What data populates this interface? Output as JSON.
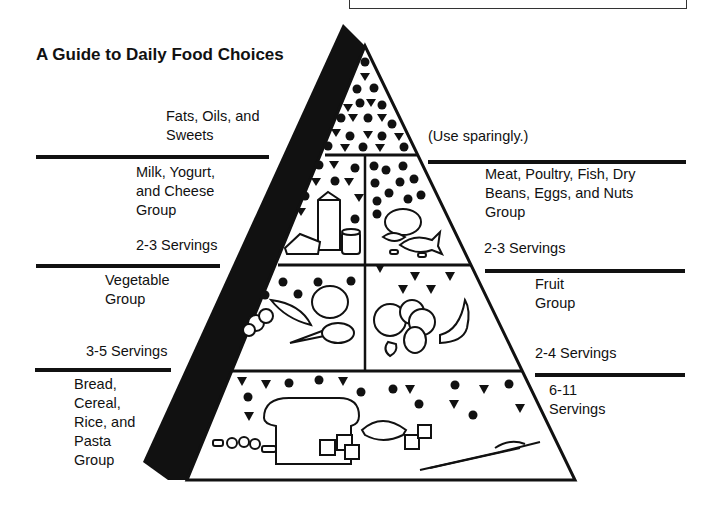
{
  "title": "A Guide to Daily Food Choices",
  "groups": {
    "fats": {
      "label_line1": "Fats, Oils, and",
      "label_line2": "Sweets",
      "servings": "(Use sparingly.)"
    },
    "milk": {
      "label_line1": "Milk, Yogurt,",
      "label_line2": "and Cheese",
      "label_line3": "Group",
      "servings": "2-3 Servings"
    },
    "meat": {
      "label_line1": "Meat, Poultry, Fish, Dry",
      "label_line2": "Beans, Eggs, and Nuts",
      "label_line3": "Group",
      "servings": "2-3 Servings"
    },
    "vegetable": {
      "label_line1": "Vegetable",
      "label_line2": "Group",
      "servings": "3-5 Servings"
    },
    "fruit": {
      "label_line1": "Fruit",
      "label_line2": "Group",
      "servings": "2-4 Servings"
    },
    "bread": {
      "label_line1": "Bread,",
      "label_line2": "Cereal,",
      "label_line3": "Rice, and",
      "label_line4": "Pasta",
      "label_line5": "Group",
      "servings_line1": "6-11",
      "servings_line2": "Servings"
    }
  },
  "legend_symbols": {
    "circle": "fat-naturally-occurring-icon",
    "triangle": "added-sugars-icon"
  },
  "colors": {
    "ink": "#111111",
    "background": "#ffffff"
  }
}
